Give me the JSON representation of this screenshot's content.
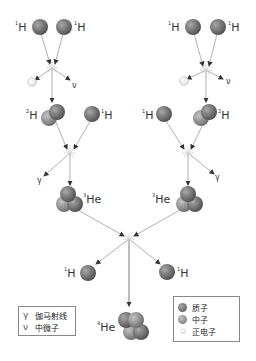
{
  "diagram": {
    "type": "proton-proton chain",
    "labels": {
      "h1": "H",
      "h1_sup": "1",
      "h2": "H",
      "h2_sup": "2",
      "he3": "He",
      "he3_sup": "3",
      "he4": "He",
      "he4_sup": "4",
      "gamma": "γ",
      "nu": "ν"
    },
    "colors": {
      "proton": "#6e6e6e",
      "neutron": "#8a8a8a",
      "positron": "#f2f2f2",
      "arrow": "#999999"
    }
  },
  "legend_left": {
    "items": [
      {
        "symbol": "γ",
        "label": "伽马射线"
      },
      {
        "symbol": "ν",
        "label": "中微子"
      }
    ]
  },
  "legend_right": {
    "items": [
      {
        "symbol": "proton-ball",
        "label": "质子"
      },
      {
        "symbol": "neutron-ball",
        "label": "中子"
      },
      {
        "symbol": "positron-ball",
        "label": "正电子"
      }
    ]
  }
}
